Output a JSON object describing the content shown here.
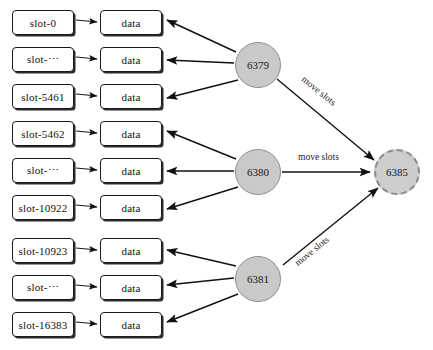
{
  "diagram": {
    "colors": {
      "node_fill": "#c9c9c9",
      "node_stroke": "#8f8f8f",
      "target_fill": "#cdcdcd",
      "target_stroke": "#8a8a8a",
      "box_stroke": "#1a1a1a",
      "box_fill": "#ffffff",
      "arrow": "#111111",
      "background": "#ffffff"
    },
    "groups": [
      {
        "node": {
          "label": "6379",
          "cx": 258,
          "cy": 65,
          "r": 23
        },
        "rows": [
          {
            "slot": "slot-0",
            "data": "data",
            "top": 10
          },
          {
            "slot": "slot-⋯",
            "data": "data",
            "top": 47
          },
          {
            "slot": "slot-5461",
            "data": "data",
            "top": 84
          }
        ],
        "move_label": "move slots"
      },
      {
        "node": {
          "label": "6380",
          "cx": 258,
          "cy": 172,
          "r": 23
        },
        "rows": [
          {
            "slot": "slot-5462",
            "data": "data",
            "top": 121
          },
          {
            "slot": "slot-⋯",
            "data": "data",
            "top": 158
          },
          {
            "slot": "slot-10922",
            "data": "data",
            "top": 195
          }
        ],
        "move_label": "move slots"
      },
      {
        "node": {
          "label": "6381",
          "cx": 258,
          "cy": 279,
          "r": 23
        },
        "rows": [
          {
            "slot": "slot-10923",
            "data": "data",
            "top": 238
          },
          {
            "slot": "slot-⋯",
            "data": "data",
            "top": 275
          },
          {
            "slot": "slot-16383",
            "data": "data",
            "top": 312
          }
        ],
        "move_label": "move slots"
      }
    ],
    "target_node": {
      "label": "6385",
      "cx": 397,
      "cy": 172,
      "r": 23
    },
    "edge_labels": {
      "top": "move slots",
      "middle": "move slots",
      "bottom": "move slots"
    }
  }
}
